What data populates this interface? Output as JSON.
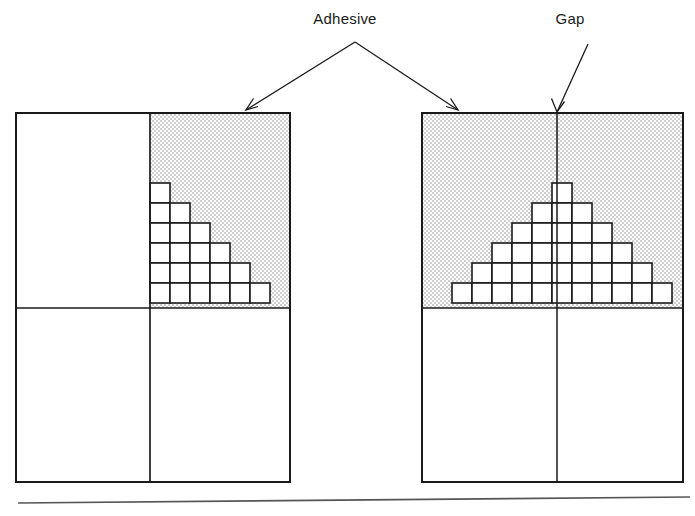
{
  "figure": {
    "width": 695,
    "height": 516,
    "background_color": "#ffffff",
    "line_color": "#1a1a1a",
    "adhesive_fill_color": "#d8d8d8",
    "cell_fill_color": "#ffffff"
  },
  "labels": {
    "adhesive": "Adhesive",
    "gap": "Gap"
  },
  "left_panel": {
    "name": "butt-joint-without-gap",
    "x": 16,
    "y": 113,
    "width": 274,
    "height": 369,
    "vertical_divider_x": 150,
    "horizontal_divider_y": 308,
    "adhesive_region": {
      "x": 150,
      "y": 113,
      "width": 140,
      "height": 195
    },
    "staircase": {
      "shape": "right-triangle",
      "cell_size": 20,
      "rows": 6,
      "row_cell_counts": [
        1,
        2,
        3,
        4,
        5,
        6
      ],
      "anchor_x": 150,
      "bottom_y": 308,
      "grows": "rightward-downward"
    }
  },
  "right_panel": {
    "name": "butt-joint-with-gap",
    "x": 422,
    "y": 113,
    "width": 261,
    "height": 369,
    "vertical_divider_x": 557,
    "horizontal_divider_y": 308,
    "adhesive_region": {
      "x": 422,
      "y": 113,
      "width": 261,
      "height": 195
    },
    "pyramid": {
      "shape": "symmetric-pyramid",
      "cell_size": 20,
      "rows": 6,
      "row_cell_counts": [
        1,
        3,
        5,
        7,
        9,
        11
      ],
      "center_x": 562,
      "bottom_y": 308,
      "grows": "outward-downward"
    }
  },
  "annotations": {
    "adhesive_label_pos": {
      "x": 345,
      "y": 24
    },
    "adhesive_apex": {
      "x": 355,
      "y": 42
    },
    "adhesive_arrow_left_tip": {
      "x": 246,
      "y": 110
    },
    "adhesive_arrow_right_tip": {
      "x": 458,
      "y": 110
    },
    "gap_label_pos": {
      "x": 570,
      "y": 24
    },
    "gap_arrow_start": {
      "x": 588,
      "y": 44
    },
    "gap_arrow_tip": {
      "x": 557,
      "y": 112
    }
  },
  "baseline_rule": {
    "x1": 18,
    "y1": 503,
    "x2": 690,
    "y2": 497
  }
}
